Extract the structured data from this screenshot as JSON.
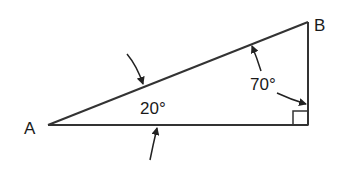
{
  "diagram": {
    "type": "right-triangle",
    "vertices": {
      "A": {
        "label": "A",
        "x": 48,
        "y": 125
      },
      "C": {
        "label": "",
        "x": 308,
        "y": 125
      },
      "B": {
        "label": "B",
        "x": 308,
        "y": 22
      }
    },
    "angles": [
      {
        "vertex": "A",
        "label": "20°"
      },
      {
        "vertex": "B",
        "label": "70°"
      },
      {
        "vertex": "C",
        "label": "right-angle-mark"
      }
    ],
    "stroke_color": "#333333",
    "text_color": "#1a1a1a",
    "background": "#ffffff"
  }
}
